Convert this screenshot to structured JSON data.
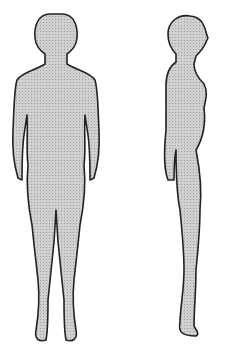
{
  "illustration": {
    "subject": "anatomical figure outline",
    "views": [
      {
        "name": "front-view",
        "label": ""
      },
      {
        "name": "side-view",
        "label": ""
      }
    ],
    "colors": {
      "fill": "#c8c8c8",
      "outline": "#222222",
      "background": "#ffffff"
    }
  }
}
